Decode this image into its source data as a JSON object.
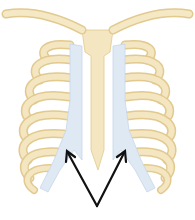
{
  "figure": {
    "parts": [
      "clavicles",
      "sternum",
      "ribs",
      "costal cartilage",
      "xiphoid process"
    ],
    "annotation": {
      "type": "two arrows",
      "target": "costal cartilage of lower ribs",
      "label": ""
    },
    "colors": {
      "bone": "#f3e6c0",
      "bone_shade": "#e2c98e",
      "cartilage": "#dfe9f4",
      "cartilage_shade": "#c7d6e8",
      "arrow": "#111111",
      "background": "#ffffff"
    }
  }
}
